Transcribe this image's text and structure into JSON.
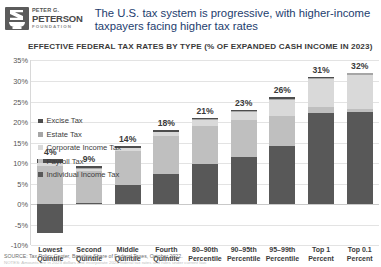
{
  "brand": {
    "logo_line1": "PETER G.",
    "logo_line2": "PETERSON",
    "logo_line3": "FOUNDATION",
    "logo_icon": "peterson-foundation-lamp-logo",
    "title_color": "#1d3d6e"
  },
  "header": {
    "title": "The U.S. tax system is progressive, with higher-income taxpayers facing higher tax rates"
  },
  "footer": {
    "source": "SOURCE: Tax Policy Center, Baseline Share of Federal Taxes, October 2022.",
    "note": "NOTES: Amounts are in 2023 dollars and incorporate 2023 federal tax rates and rules under current law."
  },
  "chart_data": {
    "type": "bar",
    "subtype": "stacked-bar",
    "title": "EFFECTIVE FEDERAL TAX RATES BY TYPE (% OF EXPANDED CASH INCOME IN 2023)",
    "xlabel": "",
    "ylabel": "",
    "ylim": [
      -10,
      35
    ],
    "ytick_step": 5,
    "yticks": [
      "35%",
      "30%",
      "25%",
      "20%",
      "15%",
      "10%",
      "5%",
      "0%",
      "-5%",
      "-10%"
    ],
    "ytick_values": [
      35,
      30,
      25,
      20,
      15,
      10,
      5,
      0,
      -5,
      -10
    ],
    "grid": true,
    "legend_position": "top-left",
    "categories": [
      "Lowest Quintile",
      "Second Quintile",
      "Middle Quintile",
      "Fourth Quintile",
      "80–90th Percentile",
      "90–95th Percentile",
      "95–99th Percentile",
      "Top 1 Percent",
      "Top 0.1 Percent"
    ],
    "categories_lines": [
      [
        "Lowest",
        "Quintile"
      ],
      [
        "Second",
        "Quintile"
      ],
      [
        "Middle",
        "Quintile"
      ],
      [
        "Fourth",
        "Quintile"
      ],
      [
        "80–90th",
        "Percentile"
      ],
      [
        "90–95th",
        "Percentile"
      ],
      [
        "95–99th",
        "Percentile"
      ],
      [
        "Top 1",
        "Percent"
      ],
      [
        "Top 0.1",
        "Percent"
      ]
    ],
    "series": [
      {
        "name": "Individual Income Tax",
        "color": "#585858",
        "values": [
          -7.0,
          0.3,
          4.6,
          7.3,
          9.7,
          11.4,
          14.3,
          22.1,
          22.4
        ]
      },
      {
        "name": "Payroll Tax",
        "color": "#bfbfbf",
        "values": [
          9.3,
          7.9,
          8.3,
          9.3,
          9.4,
          9.2,
          7.2,
          1.6,
          0.9
        ]
      },
      {
        "name": "Corporate Income Tax",
        "color": "#d9d9d9",
        "values": [
          0.7,
          0.5,
          0.7,
          1.0,
          1.4,
          1.9,
          3.9,
          6.8,
          8.2
        ]
      },
      {
        "name": "Estate Tax",
        "color": "#a6a6a6",
        "values": [
          0.0,
          0.1,
          0.1,
          0.1,
          0.2,
          0.2,
          0.3,
          0.3,
          0.4
        ]
      },
      {
        "name": "Excise Tax",
        "color": "#4d4d4d",
        "values": [
          1.0,
          0.5,
          0.4,
          0.3,
          0.3,
          0.3,
          0.3,
          0.2,
          0.1
        ]
      }
    ],
    "legend_order_displayed": [
      "Excise Tax",
      "Estate Tax",
      "Corporate Income Tax",
      "Payroll Tax",
      "Individual Income Tax"
    ],
    "total_labels": [
      "4%",
      "9%",
      "14%",
      "18%",
      "21%",
      "23%",
      "26%",
      "31%",
      "32%"
    ],
    "totals": [
      4,
      9,
      14,
      18,
      21,
      23,
      26,
      31,
      32
    ]
  }
}
